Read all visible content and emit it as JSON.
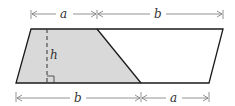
{
  "diagram": {
    "type": "geometry",
    "labels": {
      "top_a": "a",
      "top_b": "b",
      "bottom_b": "b",
      "bottom_a": "a",
      "height": "h"
    },
    "colors": {
      "stroke": "#1a1a1a",
      "shaded_fill": "#d9d9d9",
      "dimension_line": "#777777",
      "background": "#ffffff"
    },
    "shapes": {
      "parallelogram": [
        [
          31,
          29
        ],
        [
          223,
          29
        ],
        [
          209,
          83
        ],
        [
          16,
          83
        ]
      ],
      "shaded_trapezoid": [
        [
          31,
          29
        ],
        [
          97,
          29
        ],
        [
          141,
          83
        ],
        [
          16,
          83
        ]
      ]
    }
  }
}
